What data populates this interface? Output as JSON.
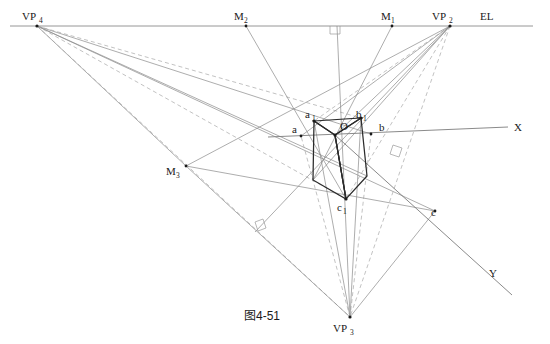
{
  "figure": {
    "caption": "图4-51",
    "title_type": "three-point perspective construction",
    "background_color": "#ffffff",
    "stroke_color_main": "#2b2b2b",
    "stroke_color_construction": "#8a8a8a",
    "stroke_color_dashed": "#a8a8a8"
  },
  "labels": {
    "vp4": {
      "base": "VP",
      "sub": "4",
      "x": 22,
      "y": 20
    },
    "vp2": {
      "base": "VP",
      "sub": "2",
      "x": 432,
      "y": 20
    },
    "vp3": {
      "base": "VP",
      "sub": "3",
      "x": 333,
      "y": 330
    },
    "m1": {
      "base": "M",
      "sub": "1",
      "x": 381,
      "y": 20
    },
    "m2": {
      "base": "M",
      "sub": "2",
      "x": 234,
      "y": 20
    },
    "m3": {
      "base": "M",
      "sub": "3",
      "x": 166,
      "y": 175
    },
    "el": {
      "base": "EL",
      "sub": "",
      "x": 480,
      "y": 18
    },
    "x_axis": {
      "base": "X",
      "sub": "",
      "x": 514,
      "y": 131
    },
    "y_axis": {
      "base": "Y",
      "sub": "",
      "x": 489,
      "y": 277
    },
    "a1": {
      "base": "a",
      "sub": "1",
      "x": 305,
      "y": 118
    },
    "b1": {
      "base": "b",
      "sub": "1",
      "x": 356,
      "y": 118
    },
    "c1": {
      "base": "c",
      "sub": "1",
      "x": 337,
      "y": 208
    },
    "a": {
      "base": "a",
      "sub": "",
      "x": 292,
      "y": 133
    },
    "b": {
      "base": "b",
      "sub": "",
      "x": 379,
      "y": 131
    },
    "c": {
      "base": "c",
      "sub": "",
      "x": 431,
      "y": 216
    },
    "o": {
      "base": "O",
      "sub": "",
      "x": 340,
      "y": 130
    }
  },
  "points": {
    "VP4": {
      "x": 37,
      "y": 26
    },
    "VP2": {
      "x": 450,
      "y": 26
    },
    "VP3": {
      "x": 350,
      "y": 317
    },
    "M1": {
      "x": 392,
      "y": 26
    },
    "M2": {
      "x": 246,
      "y": 26
    },
    "M3": {
      "x": 186,
      "y": 166
    },
    "O": {
      "x": 335,
      "y": 135
    },
    "a1": {
      "x": 314,
      "y": 121
    },
    "b1": {
      "x": 361,
      "y": 118
    },
    "c1": {
      "x": 346,
      "y": 199
    },
    "a": {
      "x": 301,
      "y": 136
    },
    "b": {
      "x": 371,
      "y": 134
    },
    "c": {
      "x": 435,
      "y": 211
    },
    "box_bl": {
      "x": 313,
      "y": 180
    },
    "box_br": {
      "x": 367,
      "y": 176
    },
    "el_left": {
      "x": 10,
      "y": 26
    },
    "el_right": {
      "x": 533,
      "y": 26
    },
    "x_left": {
      "x": 268,
      "y": 137
    },
    "x_right": {
      "x": 508,
      "y": 127
    },
    "y_end": {
      "x": 512,
      "y": 295
    },
    "plumb_top": {
      "x": 337,
      "y": 26
    },
    "plumb_bottom": {
      "x": 350,
      "y": 317
    }
  },
  "right_angle_marks": [
    {
      "name": "ra-el-plumb",
      "x": 337,
      "y": 26
    },
    {
      "name": "ra-box-right",
      "x": 398,
      "y": 150
    },
    {
      "name": "ra-lower-left",
      "x": 260,
      "y": 226
    }
  ],
  "node_names": [
    "VP4",
    "VP2",
    "VP3",
    "M1",
    "M2",
    "M3",
    "a1",
    "b1",
    "c1",
    "a",
    "b",
    "c",
    "O"
  ]
}
